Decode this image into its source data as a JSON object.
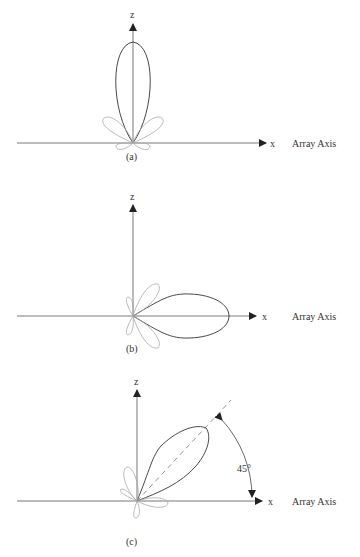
{
  "figure": {
    "axes": {
      "x_label": "x",
      "z_label": "z",
      "array_axis_label": "Array Axis"
    },
    "panels": [
      {
        "id": "a",
        "caption": "(a)",
        "main_beam_angle_deg": 90,
        "description": "Broadside main lobe along z"
      },
      {
        "id": "b",
        "caption": "(b)",
        "main_beam_angle_deg": 0,
        "description": "Endfire main lobe along x"
      },
      {
        "id": "c",
        "caption": "(c)",
        "main_beam_angle_deg": 45,
        "description": "Scanned main lobe at 45°",
        "angle_label": "45°"
      }
    ],
    "colors": {
      "main_lobe": "#333333",
      "side_lobe": "#aaaaaa",
      "axis": "#444444"
    }
  }
}
